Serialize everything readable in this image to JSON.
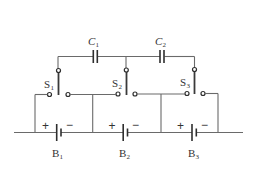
{
  "diagram": {
    "type": "circuit",
    "capacitors": [
      {
        "id": "C1",
        "label": "C",
        "sub": "1"
      },
      {
        "id": "C2",
        "label": "C",
        "sub": "2"
      }
    ],
    "switches": [
      {
        "id": "S1",
        "label": "S",
        "sub": "1"
      },
      {
        "id": "S2",
        "label": "S",
        "sub": "2"
      },
      {
        "id": "S3",
        "label": "S",
        "sub": "3"
      }
    ],
    "batteries": [
      {
        "id": "B1",
        "label": "B",
        "sub": "1",
        "plus": "+",
        "minus": "−"
      },
      {
        "id": "B2",
        "label": "B",
        "sub": "2",
        "plus": "+",
        "minus": "−"
      },
      {
        "id": "B3",
        "label": "B",
        "sub": "3",
        "plus": "+",
        "minus": "−"
      }
    ],
    "colors": {
      "wire": "#6a6a6a",
      "component": "#2e2e2e",
      "background": "#ffffff"
    }
  }
}
